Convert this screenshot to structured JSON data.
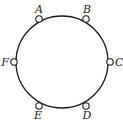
{
  "diagram": {
    "type": "circular-graph",
    "circle": {
      "cx": 62,
      "cy": 62,
      "r": 46,
      "stroke": "#1a1a1a"
    },
    "nodes": [
      {
        "id": "A",
        "label": "A",
        "x": 39,
        "y": 19,
        "lx": 39,
        "ly": 13,
        "anchor": "middle"
      },
      {
        "id": "B",
        "label": "B",
        "x": 86,
        "y": 19,
        "lx": 87,
        "ly": 13,
        "anchor": "middle"
      },
      {
        "id": "C",
        "label": "C",
        "x": 110,
        "y": 62,
        "lx": 115,
        "ly": 66,
        "anchor": "start"
      },
      {
        "id": "D",
        "label": "D",
        "x": 86,
        "y": 106,
        "lx": 87,
        "ly": 119,
        "anchor": "middle"
      },
      {
        "id": "E",
        "label": "E",
        "x": 39,
        "y": 106,
        "lx": 38,
        "ly": 119,
        "anchor": "middle"
      },
      {
        "id": "F",
        "label": "F",
        "x": 14,
        "y": 62,
        "lx": 9,
        "ly": 66,
        "anchor": "end"
      }
    ]
  }
}
